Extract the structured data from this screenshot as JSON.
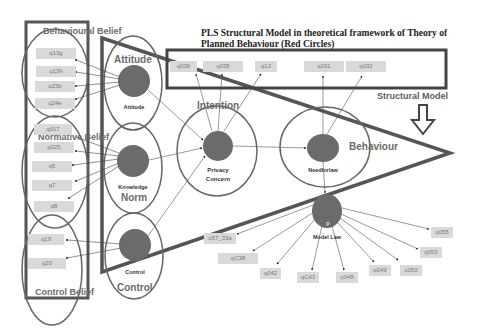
{
  "diagram": {
    "title_line1": "PLS Structural Model in theoretical framework of Theory of",
    "title_line2": "Planned Behaviour (Red Circles)",
    "structural_model_label": "Structural Model",
    "colors": {
      "construct_fill": "#6b6b6b",
      "outline": "#555555",
      "indicator_fill": "#d9d9d9",
      "indicator_text": "#7a7a7a",
      "background": "#ffffff"
    },
    "belief_groups": [
      {
        "label": "Behavioural Belief",
        "indicators": [
          "q13g",
          "q13h",
          "q23b",
          "q24e"
        ]
      },
      {
        "label": "Normative Belief",
        "indicators": [
          "q017",
          "q025",
          "q5",
          "q7",
          "q8"
        ]
      },
      {
        "label": "Control Belief",
        "indicators": [
          "q19",
          "q20"
        ]
      }
    ],
    "constructs": {
      "attitude": {
        "group_label": "Attitude",
        "node_label": "Attitude"
      },
      "norm": {
        "group_label": "Norm",
        "node_label": "Knowledge"
      },
      "control": {
        "group_label": "Control",
        "node_label": "Control"
      },
      "intention": {
        "group_label": "Intention",
        "node_label_1": "Privacy",
        "node_label_2": "Concern"
      },
      "behaviour": {
        "group_label": "Behaviour",
        "node_label": "Needforlaw"
      },
      "model_law": {
        "node_label": "Model Law",
        "node_marker": "P"
      }
    },
    "intention_indicators": [
      "q036",
      "q035",
      "q12"
    ],
    "behaviour_indicators": [
      "q031",
      "q032"
    ],
    "model_law_indicators": [
      "q57_33a",
      "qC38",
      "q042",
      "qC43",
      "c048",
      "q049",
      "c050",
      "q053",
      "q055"
    ]
  }
}
